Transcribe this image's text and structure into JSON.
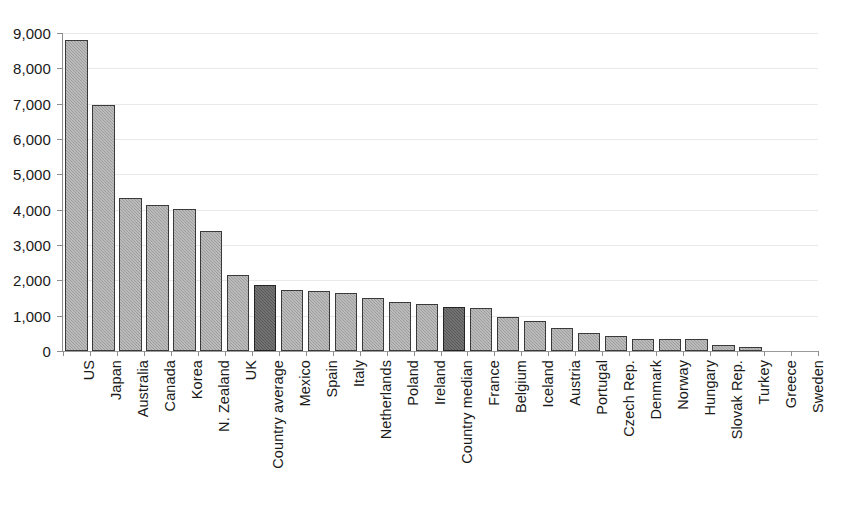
{
  "chart_data": {
    "type": "bar",
    "title": "",
    "xlabel": "",
    "ylabel": "",
    "ylim": [
      0,
      9000
    ],
    "yticks": [
      0,
      1000,
      2000,
      3000,
      4000,
      5000,
      6000,
      7000,
      8000,
      9000
    ],
    "ytick_labels": [
      "0",
      "1,000",
      "2,000",
      "3,000",
      "4,000",
      "5,000",
      "6,000",
      "7,000",
      "8,000",
      "9,000"
    ],
    "grid": true,
    "legend": "none",
    "categories": [
      "US",
      "Japan",
      "Australia",
      "Canada",
      "Korea",
      "N. Zealand",
      "UK",
      "Country average",
      "Mexico",
      "Spain",
      "Italy",
      "Netherlands",
      "Poland",
      "Ireland",
      "Country median",
      "France",
      "Belgium",
      "Iceland",
      "Austria",
      "Portugal",
      "Czech Rep.",
      "Denmark",
      "Norway",
      "Hungary",
      "Slovak Rep.",
      "Turkey",
      "Greece",
      "Sweden"
    ],
    "values": [
      8800,
      6950,
      4330,
      4130,
      4020,
      3400,
      2160,
      1880,
      1720,
      1700,
      1630,
      1490,
      1380,
      1340,
      1240,
      1220,
      960,
      860,
      650,
      510,
      420,
      350,
      340,
      340,
      180,
      110,
      0,
      0
    ],
    "highlighted_categories": [
      "Country average",
      "Country median"
    ],
    "colors": {
      "bar_fill": "#9d9d9d",
      "bar_highlight_fill": "#585858",
      "bar_border": "#3a3a3a",
      "gridline": "#e9e9e9",
      "axis": "#8d8d8d",
      "text": "#1a1a1a",
      "background": "#ffffff"
    }
  }
}
